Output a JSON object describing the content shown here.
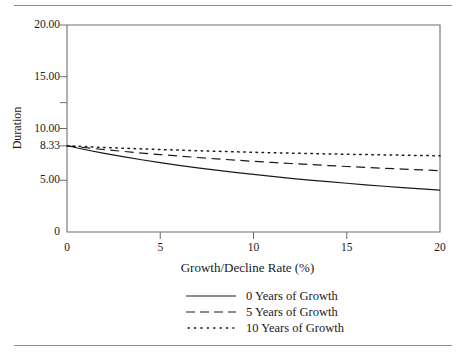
{
  "chart_data": {
    "type": "line",
    "title": "",
    "xlabel": "Growth/Decline Rate (%)",
    "ylabel": "Duration",
    "xlim": [
      0,
      20
    ],
    "ylim": [
      0,
      20
    ],
    "grid": false,
    "legend_position": "bottom",
    "x_ticks": [
      {
        "value": 0,
        "label": "0"
      },
      {
        "value": 5,
        "label": "5"
      },
      {
        "value": 10,
        "label": "10"
      },
      {
        "value": 15,
        "label": "15"
      },
      {
        "value": 20,
        "label": "20"
      }
    ],
    "y_ticks": [
      {
        "value": 0,
        "label": "0"
      },
      {
        "value": 5,
        "label": "5.00"
      },
      {
        "value": 8.33,
        "label": "8.33"
      },
      {
        "value": 10,
        "label": "10.00"
      },
      {
        "value": 15,
        "label": "15.00"
      },
      {
        "value": 20,
        "label": "20.00"
      }
    ],
    "y_minor_ticks": [
      2.5,
      7.5,
      12.5,
      17.5
    ],
    "x": [
      0,
      1,
      2,
      3,
      4,
      5,
      6,
      7,
      8,
      9,
      10,
      11,
      12,
      13,
      14,
      15,
      16,
      17,
      18,
      19,
      20
    ],
    "series": [
      {
        "name": "0 Years of Growth",
        "style": "solid",
        "color": "#1a1a1a",
        "values": [
          8.33,
          7.95,
          7.6,
          7.28,
          6.98,
          6.7,
          6.44,
          6.2,
          5.97,
          5.76,
          5.56,
          5.37,
          5.19,
          5.02,
          4.86,
          4.71,
          4.56,
          4.42,
          4.29,
          4.17,
          4.05
        ]
      },
      {
        "name": "5 Years of Growth",
        "style": "dashed",
        "color": "#1a1a1a",
        "values": [
          8.33,
          8.14,
          7.96,
          7.79,
          7.63,
          7.48,
          7.34,
          7.2,
          7.07,
          6.95,
          6.83,
          6.72,
          6.62,
          6.52,
          6.42,
          6.33,
          6.24,
          6.16,
          6.08,
          6.0,
          5.93
        ]
      },
      {
        "name": "10 Years of Growth",
        "style": "dotted",
        "color": "#1a1a1a",
        "values": [
          8.33,
          8.25,
          8.17,
          8.1,
          8.03,
          7.97,
          7.91,
          7.85,
          7.8,
          7.75,
          7.7,
          7.66,
          7.62,
          7.58,
          7.54,
          7.51,
          7.48,
          7.45,
          7.42,
          7.39,
          7.37
        ]
      }
    ]
  },
  "legend": {
    "items": [
      {
        "label": "0 Years of Growth",
        "style": "solid"
      },
      {
        "label": "5 Years of Growth",
        "style": "dashed"
      },
      {
        "label": "10 Years of Growth",
        "style": "dotted"
      }
    ]
  },
  "axes": {
    "y_title": "Duration",
    "x_title": "Growth/Decline Rate (%)",
    "y_labels": [
      "20.00",
      "15.00",
      "10.00",
      "8.33",
      "5.00",
      "0"
    ],
    "x_labels": [
      "0",
      "5",
      "10",
      "15",
      "20"
    ]
  },
  "colors": {
    "line": "#1a1a1a",
    "frame": "#6e6e6e",
    "rule": "#8d8d8d",
    "background": "#ffffff"
  }
}
